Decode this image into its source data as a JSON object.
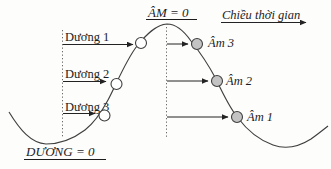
{
  "diagram": {
    "description_labels": {
      "am_zero": "ÂM = 0",
      "time_direction": "Chiều thời gian",
      "duong_zero": "DƯƠNG = 0"
    },
    "positive_points": [
      {
        "label": "Dương 1"
      },
      {
        "label": "Dương 2"
      },
      {
        "label": "Dương 3"
      }
    ],
    "negative_points": [
      {
        "label": "Âm 3"
      },
      {
        "label": "Âm 2"
      },
      {
        "label": "Âm 1"
      }
    ],
    "colors": {
      "curve": "#3f3f3f",
      "text": "#1c1c1c",
      "positive_marker_fill": "#ffffff",
      "negative_marker_fill": "#c3c3c3"
    }
  }
}
